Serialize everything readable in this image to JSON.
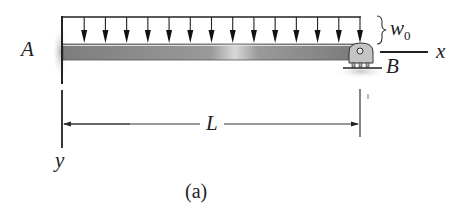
{
  "figure": {
    "caption": "(a)",
    "labels": {
      "support_left": "A",
      "support_right": "B",
      "load": "w",
      "load_sub": "0",
      "x_axis": "x",
      "y_axis": "y",
      "span": "L"
    },
    "colors": {
      "beam": "#8a8a8a",
      "line": "#222222",
      "support": "#c8c8c8"
    },
    "load_arrow_count": 14
  }
}
